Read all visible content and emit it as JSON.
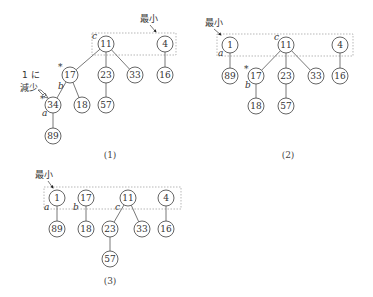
{
  "panels": [
    {
      "caption": "(1)",
      "min_label": "最小",
      "decrease_label_line1": "1 に",
      "decrease_label_line2": "減少",
      "nodes": {
        "n11": "11",
        "n4": "4",
        "n17": "17",
        "n23": "23",
        "n33": "33",
        "n16": "16",
        "n34": "34",
        "n18": "18",
        "n57": "57",
        "n89": "89"
      },
      "labels": {
        "c": "c",
        "b": "b",
        "a": "a",
        "mark17": "*",
        "mark34": "*"
      }
    },
    {
      "caption": "(2)",
      "min_label": "最小",
      "nodes": {
        "n1": "1",
        "n11": "11",
        "n4": "4",
        "n89": "89",
        "n17": "17",
        "n23": "23",
        "n33": "33",
        "n16": "16",
        "n18": "18",
        "n57": "57"
      },
      "labels": {
        "a": "a",
        "c": "c",
        "b": "b",
        "mark17": "*"
      }
    },
    {
      "caption": "(3)",
      "min_label": "最小",
      "nodes": {
        "n1": "1",
        "n17": "17",
        "n11": "11",
        "n4": "4",
        "n89": "89",
        "n18": "18",
        "n23": "23",
        "n33": "33",
        "n16": "16",
        "n57": "57"
      },
      "labels": {
        "a": "a",
        "b": "b",
        "c": "c"
      }
    }
  ]
}
